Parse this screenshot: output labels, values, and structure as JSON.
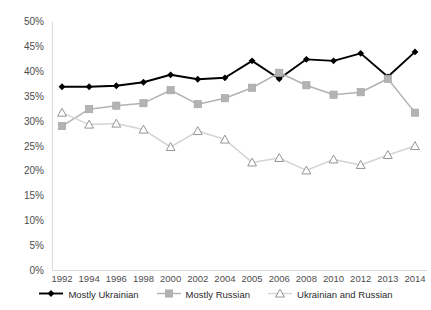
{
  "chart_data": {
    "type": "line",
    "title": "",
    "xlabel": "",
    "ylabel": "",
    "categories": [
      "1992",
      "1994",
      "1996",
      "1998",
      "2000",
      "2002",
      "2004",
      "2005",
      "2006",
      "2008",
      "2010",
      "2012",
      "2013",
      "2014"
    ],
    "ylim": [
      0,
      50
    ],
    "ytick_labels": [
      "0%",
      "5%",
      "10%",
      "15%",
      "20%",
      "25%",
      "30%",
      "35%",
      "40%",
      "45%",
      "50%"
    ],
    "ytick_values": [
      0,
      5,
      10,
      15,
      20,
      25,
      30,
      35,
      40,
      45,
      50
    ],
    "grid": false,
    "legend_position": "bottom",
    "series": [
      {
        "name": "Mostly Ukrainian",
        "color": "#000000",
        "marker": "diamond",
        "values": [
          37.0,
          37.0,
          37.2,
          37.9,
          39.4,
          38.5,
          38.8,
          42.2,
          38.6,
          42.5,
          42.2,
          43.7,
          39.0,
          44.0
        ]
      },
      {
        "name": "Mostly Russian",
        "color": "#b3b3b3",
        "marker": "square",
        "values": [
          29.1,
          32.5,
          33.2,
          33.7,
          36.3,
          33.5,
          34.7,
          36.8,
          39.8,
          37.3,
          35.4,
          35.9,
          38.6,
          31.8
        ]
      },
      {
        "name": "Ukrainian and Russian",
        "color": "#d4d4d4",
        "marker": "triangle",
        "values": [
          31.8,
          29.4,
          29.6,
          28.4,
          24.9,
          28.1,
          26.4,
          21.8,
          22.7,
          20.2,
          22.4,
          21.3,
          23.3,
          25.1
        ]
      }
    ]
  },
  "legend": {
    "items": [
      {
        "label": "Mostly Ukrainian"
      },
      {
        "label": "Mostly Russian"
      },
      {
        "label": "Ukrainian and Russian"
      }
    ]
  }
}
